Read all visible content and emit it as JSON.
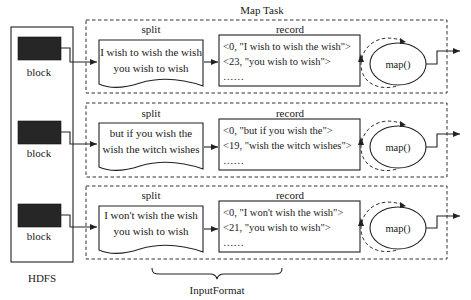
{
  "diagram": {
    "title": "Map Task",
    "hdfs_label": "HDFS",
    "input_format_label": "InputFormat",
    "colors": {
      "line": "#222222",
      "block_fill": "#262626",
      "background": "#ffffff"
    },
    "rows": [
      {
        "block_label": "block",
        "split_title": "split",
        "split_lines": [
          "I wish to wish the wish",
          "you wish to wish"
        ],
        "record_title": "record",
        "records": [
          "<0, \"I wish to wish the wish\">",
          "<23, \"you wish to wish\">",
          "……"
        ],
        "mapper_label": "map()"
      },
      {
        "block_label": "block",
        "split_title": "split",
        "split_lines": [
          "but if you wish the",
          "wish the witch wishes"
        ],
        "record_title": "record",
        "records": [
          "<0, \"but if you wish the\">",
          "<19, \"wish the witch wishes\">",
          "……"
        ],
        "mapper_label": "map()"
      },
      {
        "block_label": "block",
        "split_title": "split",
        "split_lines": [
          "I won't wish the wish",
          "you wish to wish"
        ],
        "record_title": "record",
        "records": [
          "<0, \"I won't wish the wish\">",
          "<21, \"you wish to wish\">",
          "……"
        ],
        "mapper_label": "map()"
      }
    ]
  }
}
